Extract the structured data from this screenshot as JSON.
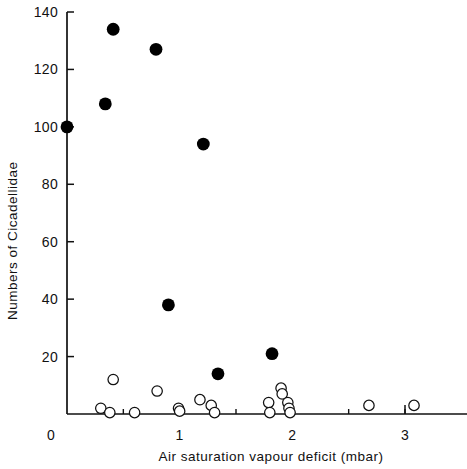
{
  "chart_data": {
    "type": "scatter",
    "title": "",
    "xlabel": "Air saturation vapour deficit (mbar)",
    "ylabel": "Numbers of Cicadellidae",
    "xlim": [
      0,
      3.35
    ],
    "ylim": [
      0,
      142
    ],
    "grid": false,
    "legend": "none",
    "x_ticks": [
      0,
      1,
      2,
      3
    ],
    "x_tick_labels": [
      "0",
      "1",
      "2",
      "3"
    ],
    "x_minor_ticks": [
      0.5,
      1.5,
      2.5,
      3.0
    ],
    "y_ticks": [
      0,
      20,
      40,
      60,
      80,
      100,
      120,
      140
    ],
    "y_tick_labels": [
      "0",
      "20",
      "40",
      "60",
      "80",
      "100",
      "120",
      "140"
    ],
    "series": [
      {
        "name": "filled",
        "marker": "filled-circle",
        "color": "#000000",
        "points": [
          {
            "x": 0.0,
            "y": 100
          },
          {
            "x": 0.34,
            "y": 108
          },
          {
            "x": 0.41,
            "y": 134
          },
          {
            "x": 0.79,
            "y": 127
          },
          {
            "x": 1.21,
            "y": 94
          },
          {
            "x": 0.9,
            "y": 38
          },
          {
            "x": 1.34,
            "y": 14
          },
          {
            "x": 1.82,
            "y": 21
          }
        ]
      },
      {
        "name": "open",
        "marker": "open-circle",
        "color": "#ffffff",
        "points": [
          {
            "x": 0.3,
            "y": 2
          },
          {
            "x": 0.38,
            "y": 0.5
          },
          {
            "x": 0.41,
            "y": 12
          },
          {
            "x": 0.6,
            "y": 0.5
          },
          {
            "x": 0.8,
            "y": 8
          },
          {
            "x": 0.99,
            "y": 2
          },
          {
            "x": 1.0,
            "y": 1
          },
          {
            "x": 1.18,
            "y": 5
          },
          {
            "x": 1.28,
            "y": 3
          },
          {
            "x": 1.31,
            "y": 0.5
          },
          {
            "x": 1.79,
            "y": 4
          },
          {
            "x": 1.8,
            "y": 0.5
          },
          {
            "x": 1.9,
            "y": 9
          },
          {
            "x": 1.91,
            "y": 7
          },
          {
            "x": 1.96,
            "y": 4
          },
          {
            "x": 1.97,
            "y": 2
          },
          {
            "x": 1.98,
            "y": 0.5
          },
          {
            "x": 2.68,
            "y": 3
          },
          {
            "x": 3.08,
            "y": 3
          }
        ]
      }
    ]
  },
  "axes": {
    "x_label": "Air saturation vapour deficit (mbar)",
    "y_label": "Numbers of Cicadellidae"
  }
}
